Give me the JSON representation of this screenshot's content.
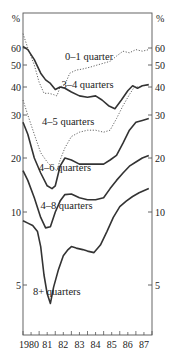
{
  "chart_data": {
    "type": "line",
    "title": "",
    "xlabel": "",
    "ylabel": "%",
    "y_scale": "log",
    "ylim": [
      3.6,
      75
    ],
    "xlim": [
      1980,
      1987.9
    ],
    "grid": false,
    "x_ticks": [
      "1980",
      "81",
      "82",
      "83",
      "84",
      "85",
      "86",
      "87"
    ],
    "y_ticks_left": [
      "60",
      "50",
      "40",
      "30",
      "20",
      "10",
      "5"
    ],
    "y_ticks_right": [
      "60",
      "50",
      "40",
      "30",
      "20",
      "10",
      "5"
    ],
    "y_unit_left": "%",
    "y_unit_right": "%",
    "series": [
      {
        "name": "0–1 quarter",
        "style": "dotted",
        "points": [
          [
            1980.0,
            70
          ],
          [
            1980.3,
            60
          ],
          [
            1980.7,
            50
          ],
          [
            1981.0,
            42
          ],
          [
            1981.3,
            37.5
          ],
          [
            1981.6,
            37.5
          ],
          [
            1981.9,
            37
          ],
          [
            1982.1,
            36.5
          ],
          [
            1982.3,
            40
          ],
          [
            1982.6,
            41
          ],
          [
            1982.9,
            46
          ],
          [
            1983.3,
            47.5
          ],
          [
            1983.7,
            48
          ],
          [
            1984.2,
            49
          ],
          [
            1984.6,
            50
          ],
          [
            1985.0,
            51
          ],
          [
            1985.4,
            52
          ],
          [
            1985.8,
            55
          ],
          [
            1986.2,
            58
          ],
          [
            1986.6,
            57
          ],
          [
            1987.0,
            59
          ],
          [
            1987.4,
            58
          ],
          [
            1987.8,
            59
          ]
        ]
      },
      {
        "name": "3–4 quarters",
        "style": "solid",
        "points": [
          [
            1980.0,
            61
          ],
          [
            1980.3,
            59
          ],
          [
            1980.7,
            53
          ],
          [
            1981.1,
            46
          ],
          [
            1981.4,
            43
          ],
          [
            1981.7,
            41.5
          ],
          [
            1982.0,
            39
          ],
          [
            1982.3,
            40
          ],
          [
            1982.6,
            39.5
          ],
          [
            1983.0,
            38
          ],
          [
            1983.5,
            36.5
          ],
          [
            1984.0,
            36
          ],
          [
            1984.5,
            36.5
          ],
          [
            1984.9,
            35
          ],
          [
            1985.3,
            33
          ],
          [
            1985.7,
            32
          ],
          [
            1986.1,
            35
          ],
          [
            1986.5,
            38.5
          ],
          [
            1986.8,
            40.5
          ],
          [
            1987.1,
            39.5
          ],
          [
            1987.4,
            40.5
          ],
          [
            1987.8,
            41
          ]
        ]
      },
      {
        "name": "4–5 quarters",
        "style": "dotted",
        "points": [
          [
            1980.0,
            35
          ],
          [
            1980.3,
            30
          ],
          [
            1980.7,
            25
          ],
          [
            1981.1,
            21
          ],
          [
            1981.5,
            19
          ],
          [
            1981.9,
            17.5
          ],
          [
            1982.1,
            17
          ],
          [
            1982.3,
            19.5
          ],
          [
            1982.6,
            22
          ],
          [
            1983.0,
            24.5
          ],
          [
            1983.5,
            25.5
          ],
          [
            1984.0,
            26
          ],
          [
            1984.5,
            26
          ],
          [
            1985.0,
            25.5
          ],
          [
            1985.4,
            26
          ],
          [
            1985.8,
            29
          ],
          [
            1986.2,
            33
          ],
          [
            1986.6,
            37
          ],
          [
            1986.9,
            40
          ],
          [
            1987.2,
            40
          ]
        ]
      },
      {
        "name": "4–6 quarters",
        "style": "solid",
        "points": [
          [
            1980.0,
            28
          ],
          [
            1980.3,
            25
          ],
          [
            1980.7,
            20
          ],
          [
            1981.1,
            16.5
          ],
          [
            1981.5,
            14
          ],
          [
            1981.8,
            13.5
          ],
          [
            1982.0,
            14
          ],
          [
            1982.3,
            18
          ],
          [
            1982.6,
            20
          ],
          [
            1983.0,
            19.5
          ],
          [
            1983.5,
            18.5
          ],
          [
            1984.0,
            18.5
          ],
          [
            1984.5,
            18.5
          ],
          [
            1985.0,
            18.5
          ],
          [
            1985.4,
            19.5
          ],
          [
            1985.8,
            20.5
          ],
          [
            1986.2,
            23
          ],
          [
            1986.6,
            26
          ],
          [
            1987.0,
            28
          ],
          [
            1987.4,
            28.5
          ],
          [
            1987.8,
            29
          ]
        ]
      },
      {
        "name": "4–8 quarters",
        "style": "solid",
        "points": [
          [
            1980.0,
            17
          ],
          [
            1980.3,
            15
          ],
          [
            1980.7,
            12
          ],
          [
            1981.1,
            9.5
          ],
          [
            1981.4,
            8.6
          ],
          [
            1981.7,
            8.7
          ],
          [
            1982.0,
            10
          ],
          [
            1982.3,
            11.5
          ],
          [
            1982.6,
            12.5
          ],
          [
            1983.0,
            12.6
          ],
          [
            1983.5,
            12
          ],
          [
            1984.0,
            11.7
          ],
          [
            1984.5,
            11.7
          ],
          [
            1985.0,
            12
          ],
          [
            1985.4,
            13.5
          ],
          [
            1985.8,
            15
          ],
          [
            1986.2,
            16.5
          ],
          [
            1986.6,
            18
          ],
          [
            1987.0,
            19
          ],
          [
            1987.4,
            20
          ],
          [
            1987.8,
            20.5
          ]
        ]
      },
      {
        "name": "8+ quarters",
        "style": "solid",
        "points": [
          [
            1980.0,
            9.2
          ],
          [
            1980.3,
            9.0
          ],
          [
            1980.6,
            8.8
          ],
          [
            1980.9,
            8.3
          ],
          [
            1981.1,
            7.2
          ],
          [
            1981.3,
            5.5
          ],
          [
            1981.5,
            4.6
          ],
          [
            1981.7,
            4.2
          ],
          [
            1981.9,
            4.9
          ],
          [
            1982.2,
            5.8
          ],
          [
            1982.5,
            6.6
          ],
          [
            1982.8,
            7.0
          ],
          [
            1983.0,
            7.2
          ],
          [
            1983.3,
            7.1
          ],
          [
            1983.7,
            7.0
          ],
          [
            1984.0,
            6.9
          ],
          [
            1984.4,
            6.8
          ],
          [
            1984.8,
            7.3
          ],
          [
            1985.2,
            8.3
          ],
          [
            1985.6,
            9.5
          ],
          [
            1986.0,
            10.7
          ],
          [
            1986.4,
            11.5
          ],
          [
            1986.8,
            12.2
          ],
          [
            1987.2,
            12.8
          ],
          [
            1987.8,
            13.5
          ]
        ]
      }
    ],
    "annotations": [
      {
        "text": "0–1 quarter",
        "x": 1984.1,
        "y": 55
      },
      {
        "text": "3–4 quarters",
        "x": 1984.0,
        "y": 41
      },
      {
        "text": "4–5 quarters",
        "x": 1982.8,
        "y": 28.3
      },
      {
        "text": "4–6 quarters",
        "x": 1982.6,
        "y": 17.6
      },
      {
        "text": "4–8 quarters",
        "x": 1982.7,
        "y": 10.9
      },
      {
        "text": "8+ quarters",
        "x": 1982.1,
        "y": 4.7
      }
    ]
  },
  "layout": {
    "frame": {
      "left": 23,
      "right": 152,
      "top": 13,
      "bottom": 335
    },
    "y_tick_pixels": {
      "60": 48,
      "50": 65,
      "40": 87,
      "30": 115,
      "20": 158,
      "10": 212,
      "5": 285
    },
    "x_year_pixels": {
      "1980": 23,
      "1988": 152
    }
  }
}
